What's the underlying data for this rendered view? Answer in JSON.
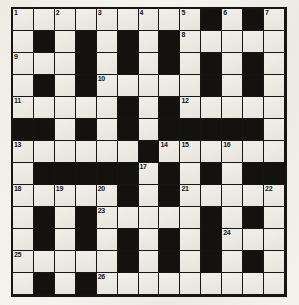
{
  "puzzle": {
    "type": "crossword-grid",
    "rows": 13,
    "columns": 13,
    "cell_colors": {
      "white": "#eceae3",
      "black": "#14120f",
      "grid_line": "#171512",
      "paper": "#f2f0ea"
    },
    "grid": [
      [
        "w1",
        "w",
        "w2",
        "w",
        "w3",
        "w",
        "w4",
        "w",
        "w5",
        "b",
        "w6",
        "b",
        "w7"
      ],
      [
        "w",
        "b",
        "w",
        "b",
        "w",
        "b",
        "w",
        "b",
        "w8",
        "w",
        "w",
        "w",
        "w"
      ],
      [
        "w9",
        "w",
        "w",
        "b",
        "w",
        "b",
        "w",
        "b",
        "w",
        "b",
        "w",
        "b",
        "w"
      ],
      [
        "w",
        "b",
        "w",
        "b",
        "w10",
        "w",
        "w",
        "w",
        "w",
        "b",
        "w",
        "b",
        "w"
      ],
      [
        "w11",
        "w",
        "w",
        "w",
        "w",
        "b",
        "w",
        "b",
        "w12",
        "w",
        "w",
        "w",
        "w"
      ],
      [
        "b",
        "b",
        "w",
        "b",
        "w",
        "b",
        "w",
        "b",
        "b",
        "b",
        "b",
        "b",
        "w"
      ],
      [
        "w13",
        "w",
        "w",
        "w",
        "w",
        "w",
        "b",
        "w14",
        "w15",
        "w",
        "w16",
        "w",
        "w"
      ],
      [
        "w",
        "b",
        "b",
        "b",
        "b",
        "b",
        "w17",
        "b",
        "w",
        "b",
        "w",
        "b",
        "b"
      ],
      [
        "w18",
        "w",
        "w19",
        "w",
        "w20",
        "b",
        "w",
        "b",
        "w21",
        "w",
        "w",
        "w",
        "w22"
      ],
      [
        "w",
        "b",
        "w",
        "b",
        "w23",
        "w",
        "w",
        "w",
        "w",
        "b",
        "w",
        "b",
        "w"
      ],
      [
        "w",
        "b",
        "w",
        "b",
        "w",
        "b",
        "w",
        "b",
        "w",
        "b",
        "w24",
        "w",
        "w"
      ],
      [
        "w25",
        "w",
        "w",
        "w",
        "w",
        "b",
        "w",
        "b",
        "w",
        "b",
        "w",
        "b",
        "w"
      ],
      [
        "w",
        "b",
        "w",
        "b",
        "w26",
        "w",
        "w",
        "w",
        "w",
        "w",
        "w",
        "w",
        "w"
      ]
    ],
    "numbers": [
      {
        "n": "1",
        "row": 1,
        "col": 1
      },
      {
        "n": "2",
        "row": 1,
        "col": 3
      },
      {
        "n": "3",
        "row": 1,
        "col": 5
      },
      {
        "n": "4",
        "row": 1,
        "col": 7
      },
      {
        "n": "5",
        "row": 1,
        "col": 9
      },
      {
        "n": "6",
        "row": 1,
        "col": 11
      },
      {
        "n": "7",
        "row": 1,
        "col": 13
      },
      {
        "n": "8",
        "row": 2,
        "col": 9
      },
      {
        "n": "9",
        "row": 3,
        "col": 1
      },
      {
        "n": "10",
        "row": 4,
        "col": 5
      },
      {
        "n": "11",
        "row": 5,
        "col": 1
      },
      {
        "n": "12",
        "row": 5,
        "col": 9
      },
      {
        "n": "13",
        "row": 7,
        "col": 1
      },
      {
        "n": "14",
        "row": 7,
        "col": 8
      },
      {
        "n": "15",
        "row": 7,
        "col": 9
      },
      {
        "n": "16",
        "row": 7,
        "col": 11
      },
      {
        "n": "17",
        "row": 8,
        "col": 7
      },
      {
        "n": "18",
        "row": 9,
        "col": 1
      },
      {
        "n": "19",
        "row": 9,
        "col": 3
      },
      {
        "n": "20",
        "row": 9,
        "col": 5
      },
      {
        "n": "21",
        "row": 9,
        "col": 9
      },
      {
        "n": "22",
        "row": 9,
        "col": 13
      },
      {
        "n": "23",
        "row": 10,
        "col": 5
      },
      {
        "n": "24",
        "row": 11,
        "col": 11
      },
      {
        "n": "25",
        "row": 12,
        "col": 1
      },
      {
        "n": "26",
        "row": 13,
        "col": 5
      }
    ]
  }
}
